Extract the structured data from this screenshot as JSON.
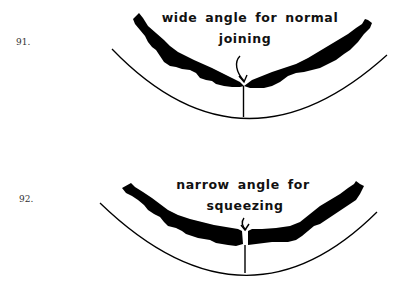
{
  "figures": [
    {
      "number": "91.",
      "caption_line1": "wide angle for normal",
      "caption_line2": "joining",
      "angle": "wide"
    },
    {
      "number": "92.",
      "caption_line1": "narrow angle for",
      "caption_line2": "squeezing",
      "angle": "narrow"
    }
  ],
  "colors": {
    "ink": "#000000",
    "background": "#ffffff"
  }
}
